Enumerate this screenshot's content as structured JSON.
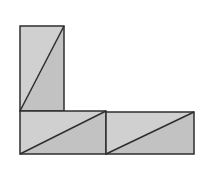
{
  "diagram": {
    "colors": {
      "background": "#ffffff",
      "fill_light": "#d0d0d0",
      "fill_dark": "#c2c2c2",
      "stroke": "#2e2e2e"
    },
    "rectangles": [
      {
        "id": "vertical-rect",
        "x": 20,
        "y": 26,
        "w": 44,
        "h": 85,
        "diagonal": {
          "x1": 20,
          "y1": 111,
          "x2": 64,
          "y2": 26
        }
      },
      {
        "id": "bottom-left-rect",
        "x": 20,
        "y": 111,
        "w": 86,
        "h": 43,
        "diagonal": {
          "x1": 20,
          "y1": 154,
          "x2": 106,
          "y2": 111
        }
      },
      {
        "id": "bottom-right-rect",
        "x": 106,
        "y": 112,
        "w": 88,
        "h": 42,
        "diagonal": {
          "x1": 106,
          "y1": 154,
          "x2": 194,
          "y2": 112
        }
      }
    ]
  }
}
